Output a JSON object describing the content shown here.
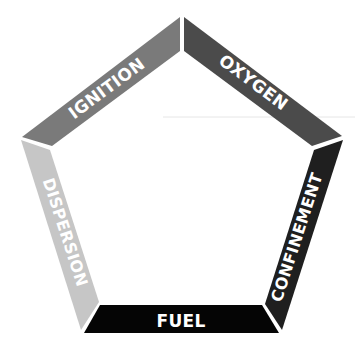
{
  "diagram": {
    "segments": [
      {
        "id": "ignition",
        "label": "IGNITION",
        "color": "#7a7a7a"
      },
      {
        "id": "oxygen",
        "label": "OXYGEN",
        "color": "#4b4b4b"
      },
      {
        "id": "confinement",
        "label": "CONFINEMENT",
        "color": "#1f1f1f"
      },
      {
        "id": "fuel",
        "label": "FUEL",
        "color": "#050505"
      },
      {
        "id": "dispersion",
        "label": "DISPERSION",
        "color": "#c6c6c6"
      }
    ],
    "guide_line_color": "#e6e6e6"
  }
}
